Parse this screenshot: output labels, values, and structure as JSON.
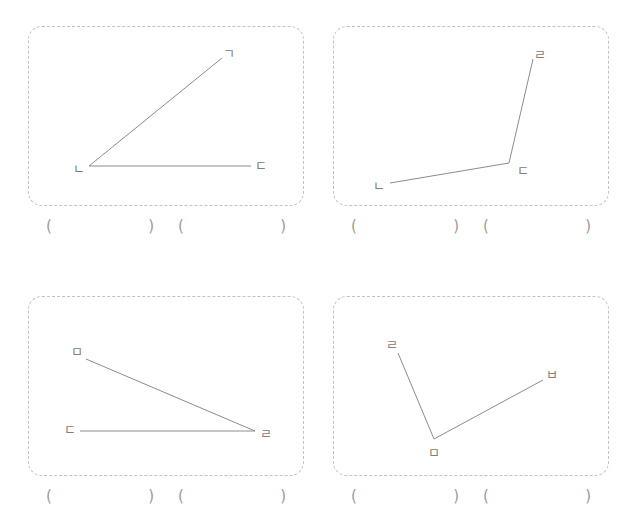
{
  "worksheet": {
    "title": "",
    "line_color": "#8c8c8c",
    "label_color": "#808080",
    "panel_border_color": "#c3c3c3",
    "paren_color": "#9a9a9a",
    "open_paren": "(",
    "close_paren": ")"
  },
  "problems": [
    {
      "id": "problem-1",
      "labels": {
        "vertex_top": "ㄱ",
        "vertex_corner": "ㄴ",
        "vertex_right": "ㄷ"
      },
      "answers": [
        {
          "value": ""
        },
        {
          "value": ""
        }
      ]
    },
    {
      "id": "problem-2",
      "labels": {
        "vertex_top": "ㄹ",
        "vertex_corner": "ㄷ",
        "vertex_left": "ㄴ"
      },
      "answers": [
        {
          "value": ""
        },
        {
          "value": ""
        }
      ]
    },
    {
      "id": "problem-3",
      "labels": {
        "vertex_top": "ㅁ",
        "vertex_left": "ㄷ",
        "vertex_corner": "ㄹ"
      },
      "answers": [
        {
          "value": ""
        },
        {
          "value": ""
        }
      ]
    },
    {
      "id": "problem-4",
      "labels": {
        "vertex_left": "ㄹ",
        "vertex_right": "ㅂ",
        "vertex_corner": "ㅁ"
      },
      "answers": [
        {
          "value": ""
        },
        {
          "value": ""
        }
      ]
    }
  ]
}
